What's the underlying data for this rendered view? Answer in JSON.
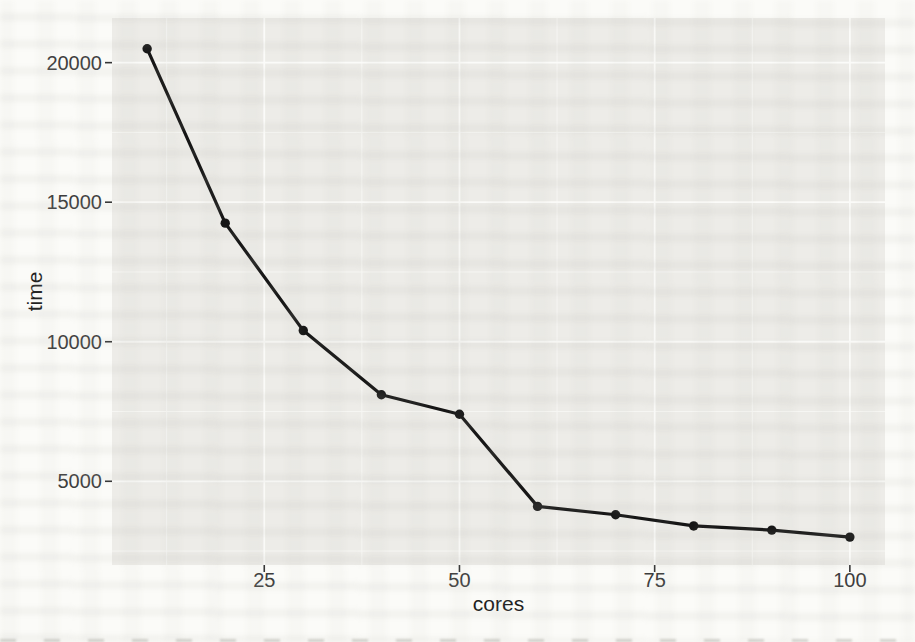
{
  "page": {
    "kind": "scanned book page with statistics chart",
    "paper_color": "#fbfbf8"
  },
  "chart_data": {
    "type": "line",
    "title": "",
    "xlabel": "cores",
    "ylabel": "time",
    "x": [
      10,
      20,
      30,
      40,
      50,
      60,
      70,
      80,
      90,
      100
    ],
    "y": [
      20500,
      14250,
      10400,
      8100,
      7400,
      4100,
      3800,
      3400,
      3250,
      3000
    ],
    "series": [
      {
        "name": "time",
        "x": [
          10,
          20,
          30,
          40,
          50,
          60,
          70,
          80,
          90,
          100
        ],
        "values": [
          20500,
          14250,
          10400,
          8100,
          7400,
          4100,
          3800,
          3400,
          3250,
          3000
        ]
      }
    ],
    "x_ticks": [
      25,
      50,
      75,
      100
    ],
    "x_tick_labels": [
      "25",
      "50",
      "75",
      "100"
    ],
    "y_ticks": [
      5000,
      10000,
      15000,
      20000
    ],
    "y_tick_labels": [
      "5000",
      "10000",
      "15000",
      "20000"
    ],
    "xlim": [
      5.5,
      104.5
    ],
    "ylim": [
      2000,
      21600
    ],
    "grid": "on",
    "grid_style": "white major and minor gridlines on gray panel (ggplot2 theme_gray)",
    "legend": "none",
    "marker": "filled-circle",
    "colors": {
      "panel": "#edece8",
      "grid_major": "#fbfbf9",
      "grid_minor": "#f6f6f3",
      "line": "#161616",
      "point": "#161616",
      "tick_mark": "#343434",
      "tick_label": "#3d3d3d",
      "axis_title": "#1f1f1f"
    }
  }
}
